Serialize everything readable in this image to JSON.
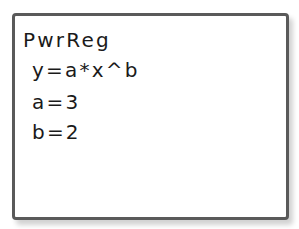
{
  "calculator_screen": {
    "lines": [
      "PwrReg",
      "y=a*x^b",
      "a=3",
      "b=2"
    ]
  },
  "colors": {
    "border": "#5a5a5a",
    "text": "#1a1a1a",
    "background": "#ffffff"
  }
}
